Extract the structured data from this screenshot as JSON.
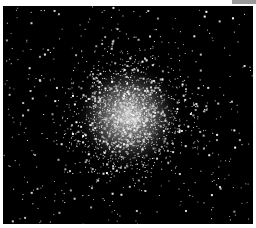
{
  "image": {
    "subject": "globular star cluster",
    "description": "Dense spherical cluster of stars against black sky, brightest at center",
    "background_color": "#000000",
    "border_color": "#ffffff",
    "core_color": "#e8e8e8",
    "star_color": "#ffffff"
  }
}
